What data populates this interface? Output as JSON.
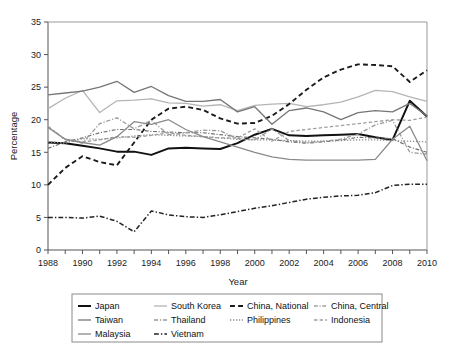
{
  "chart_data": {
    "type": "line",
    "title": "",
    "xlabel": "Year",
    "ylabel": "Percentage",
    "xlim": [
      1988,
      2010
    ],
    "ylim": [
      0,
      35
    ],
    "yticks": [
      0,
      5,
      10,
      15,
      20,
      25,
      30,
      35
    ],
    "xticks": [
      1988,
      1990,
      1992,
      1994,
      1996,
      1998,
      2000,
      2002,
      2004,
      2006,
      2008,
      2010
    ],
    "xtick_minor_step": 1,
    "grid": false,
    "legend_position": "below-outside",
    "x": [
      1988,
      1989,
      1990,
      1991,
      1992,
      1993,
      1994,
      1995,
      1996,
      1997,
      1998,
      1999,
      2000,
      2001,
      2002,
      2003,
      2004,
      2005,
      2006,
      2007,
      2008,
      2009,
      2010
    ],
    "series": [
      {
        "name": "Japan",
        "color": "#111111",
        "dash": "solid",
        "width": 2.0,
        "values": [
          16.5,
          16.4,
          16.0,
          15.6,
          15.1,
          15.1,
          14.6,
          15.6,
          15.7,
          15.6,
          15.5,
          16.4,
          17.7,
          18.6,
          17.6,
          17.5,
          17.6,
          17.7,
          17.8,
          17.3,
          16.9,
          22.9,
          20.5
        ]
      },
      {
        "name": "South Korea",
        "color": "#b4b4b4",
        "dash": "solid",
        "width": 1.3,
        "values": [
          21.7,
          23.3,
          24.5,
          21.1,
          22.9,
          23.0,
          23.2,
          22.6,
          22.5,
          22.1,
          22.3,
          21.4,
          22.2,
          22.4,
          22.5,
          22.0,
          22.3,
          22.7,
          23.5,
          24.5,
          24.3,
          23.5,
          22.8
        ]
      },
      {
        "name": "China, National",
        "color": "#1a1a1a",
        "dash": "dashed",
        "width": 1.9,
        "values": [
          10.0,
          12.6,
          14.4,
          13.5,
          13.0,
          16.5,
          20.0,
          21.7,
          22.0,
          21.5,
          20.2,
          19.4,
          19.5,
          20.6,
          22.4,
          24.6,
          26.5,
          27.7,
          28.5,
          28.4,
          28.2,
          25.8,
          27.6
        ]
      },
      {
        "name": "China, Central",
        "color": "#6e6e6e",
        "dash": "dashdot",
        "width": 1.2,
        "values": [
          15.6,
          16.6,
          17.2,
          18.0,
          18.5,
          18.5,
          18.2,
          18.1,
          18.0,
          18.0,
          17.7,
          17.4,
          17.2,
          17.0,
          16.6,
          16.4,
          16.6,
          16.9,
          17.3,
          17.2,
          17.1,
          15.8,
          15.0
        ]
      },
      {
        "name": "Taiwan",
        "color": "#767676",
        "dash": "solid",
        "width": 1.3,
        "values": [
          23.8,
          24.1,
          24.4,
          25.0,
          25.9,
          24.2,
          25.1,
          23.7,
          22.8,
          22.8,
          23.1,
          21.2,
          22.0,
          19.3,
          21.4,
          21.8,
          21.2,
          20.0,
          21.1,
          21.4,
          21.2,
          22.5,
          20.6
        ]
      },
      {
        "name": "Thailand",
        "color": "#9a9a9a",
        "dash": "dashdot",
        "width": 1.3,
        "values": [
          18.9,
          17.0,
          16.4,
          19.4,
          20.3,
          18.6,
          19.9,
          17.7,
          18.0,
          18.4,
          18.3,
          17.1,
          16.9,
          18.6,
          16.8,
          16.5,
          16.7,
          17.0,
          17.8,
          19.2,
          19.9,
          15.0,
          14.7
        ]
      },
      {
        "name": "Philippines",
        "color": "#8e8e8e",
        "dash": "dotted",
        "width": 1.3,
        "values": [
          16.6,
          16.4,
          17.1,
          17.0,
          17.2,
          17.5,
          17.7,
          17.6,
          17.5,
          17.4,
          17.2,
          17.0,
          16.9,
          16.9,
          16.8,
          16.7,
          16.7,
          16.8,
          16.9,
          16.9,
          16.8,
          16.7,
          16.6
        ]
      },
      {
        "name": "Indonesia",
        "color": "#9e9e9e",
        "dash": "dashed",
        "width": 1.3,
        "values": [
          19.0,
          16.9,
          16.6,
          16.9,
          17.4,
          17.3,
          17.6,
          18.0,
          17.6,
          17.4,
          17.2,
          17.2,
          18.6,
          16.7,
          18.2,
          18.5,
          18.8,
          19.1,
          19.4,
          19.7,
          20.0,
          19.9,
          20.4
        ]
      },
      {
        "name": "Malaysia",
        "color": "#8a8a8a",
        "dash": "solid",
        "width": 1.3,
        "values": [
          18.8,
          17.0,
          16.5,
          16.1,
          17.4,
          19.7,
          19.3,
          20.0,
          18.5,
          17.4,
          16.6,
          15.8,
          15.0,
          14.3,
          13.9,
          13.8,
          13.8,
          13.8,
          13.8,
          13.9,
          17.0,
          19.0,
          13.7
        ]
      },
      {
        "name": "Vietnam",
        "color": "#222222",
        "dash": "dashdot",
        "width": 1.5,
        "values": [
          5.0,
          5.0,
          4.9,
          5.2,
          4.4,
          2.8,
          6.0,
          5.4,
          5.1,
          5.0,
          5.4,
          5.9,
          6.4,
          6.8,
          7.3,
          7.8,
          8.1,
          8.3,
          8.4,
          8.8,
          9.9,
          10.1,
          10.1
        ]
      }
    ]
  },
  "legend": {
    "rows": [
      [
        {
          "label": "Japan",
          "key": "japan"
        },
        {
          "label": "South Korea",
          "key": "south-korea"
        },
        {
          "label": "China, National",
          "key": "china-national"
        },
        {
          "label": "China, Central",
          "key": "china-central"
        }
      ],
      [
        {
          "label": "Taiwan",
          "key": "taiwan"
        },
        {
          "label": "Thailand",
          "key": "thailand"
        },
        {
          "label": "Philippines",
          "key": "philippines"
        },
        {
          "label": "Indonesia",
          "key": "indonesia"
        }
      ],
      [
        {
          "label": "Malaysia",
          "key": "malaysia"
        },
        {
          "label": "Vietnam",
          "key": "vietnam"
        }
      ]
    ]
  },
  "axes": {
    "ylabel": "Percentage",
    "xlabel": "Year",
    "ytick_labels": [
      "0",
      "5",
      "10",
      "15",
      "20",
      "25",
      "30",
      "35"
    ],
    "xtick_labels": [
      "1988",
      "1990",
      "1992",
      "1994",
      "1996",
      "1998",
      "2000",
      "2002",
      "2004",
      "2006",
      "2008",
      "2010"
    ]
  }
}
